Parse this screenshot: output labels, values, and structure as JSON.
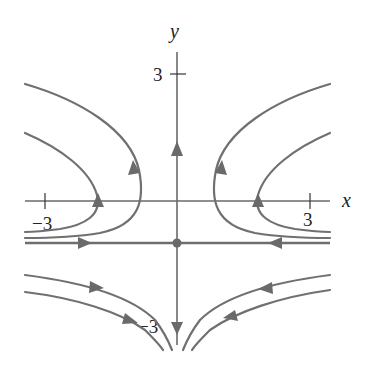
{
  "diagram": {
    "type": "phase-portrait",
    "axes": {
      "x_label": "x",
      "y_label": "y",
      "x_ticks": [
        {
          "value": -3,
          "label": "−3"
        },
        {
          "value": 3,
          "label": "3"
        }
      ],
      "y_ticks": [
        {
          "value": 3,
          "label": "3"
        },
        {
          "value": -3,
          "label": "−3"
        }
      ]
    },
    "equilibrium": {
      "x": 0,
      "y": -1,
      "kind": "saddle"
    },
    "separatrices": [
      {
        "name": "horizontal-left",
        "direction": "toward equilibrium"
      },
      {
        "name": "horizontal-right",
        "direction": "toward equilibrium"
      },
      {
        "name": "vertical-up",
        "direction": "away from equilibrium"
      },
      {
        "name": "vertical-down",
        "direction": "away from equilibrium"
      }
    ],
    "trajectories": [
      {
        "region": "upper-left",
        "count": 2,
        "direction": "come in from left along y≈-1, turn, exit up-left"
      },
      {
        "region": "upper-right",
        "count": 2,
        "direction": "come in from right along y≈-1, turn, exit up-right"
      },
      {
        "region": "lower-left",
        "count": 2,
        "direction": "come in from left, bend downward"
      },
      {
        "region": "lower-right",
        "count": 2,
        "direction": "come in from right, bend downward"
      }
    ],
    "colors": {
      "curves": "#707070",
      "text": "#222222",
      "background": "#ffffff"
    }
  }
}
